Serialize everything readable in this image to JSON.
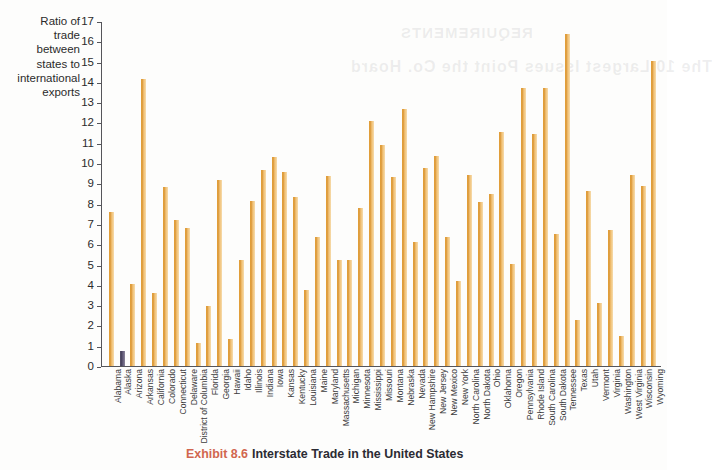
{
  "caption": {
    "number": "Exhibit 8.6",
    "text": "Interstate Trade in the United States"
  },
  "bleed_text": {
    "line1": "REQUIREMENTS",
    "line2": "The 10 Largest Issues Point the Co.  Hoard"
  },
  "y_axis_title_lines": [
    "Ratio of",
    "trade",
    "between",
    "states to",
    "international",
    "exports"
  ],
  "colors": {
    "bar": "#e0a040",
    "bar_highlight": "#f3cf93",
    "bar_alt": "#575168",
    "axis": "#55555a",
    "caption_number": "#d1664f",
    "caption_text": "#2b2b33",
    "background": "#fdfdfc"
  },
  "chart_data": {
    "type": "bar",
    "title": "Interstate Trade in the United States",
    "xlabel": "",
    "ylabel": "Ratio of trade between states to international exports",
    "ylim": [
      0,
      17
    ],
    "ytick_step": 1,
    "yticks": [
      0,
      1,
      2,
      3,
      4,
      5,
      6,
      7,
      8,
      9,
      10,
      11,
      12,
      13,
      14,
      15,
      16,
      17
    ],
    "grid": false,
    "legend": "none",
    "categories": [
      "Alabama",
      "Alaska",
      "Arizona",
      "Arkansas",
      "California",
      "Colorado",
      "Connecticut",
      "Delaware",
      "District of Columbia",
      "Florida",
      "Georgia",
      "Hawaii",
      "Idaho",
      "Illinois",
      "Indiana",
      "Iowa",
      "Kansas",
      "Kentucky",
      "Louisiana",
      "Maine",
      "Maryland",
      "Massachusetts",
      "Michigan",
      "Minnesota",
      "Mississippi",
      "Missouri",
      "Montana",
      "Nebraska",
      "Nevada",
      "New Hampshire",
      "New Jersey",
      "New Mexico",
      "New York",
      "North Carolina",
      "North Dakota",
      "Ohio",
      "Oklahoma",
      "Oregon",
      "Pennsylvania",
      "Rhode Island",
      "South Carolina",
      "South Dakota",
      "Tennessee",
      "Texas",
      "Utah",
      "Vermont",
      "Virginia",
      "Washington",
      "West Virginia",
      "Wisconsin",
      "Wyoming"
    ],
    "values": [
      7.6,
      0.75,
      4.05,
      14.15,
      3.6,
      8.8,
      7.2,
      6.8,
      1.15,
      2.95,
      9.15,
      1.35,
      5.2,
      8.15,
      9.65,
      10.3,
      9.55,
      8.35,
      3.75,
      6.35,
      9.35,
      5.2,
      5.2,
      7.8,
      12.05,
      10.9,
      9.3,
      12.65,
      6.1,
      9.75,
      10.35,
      6.35,
      4.2,
      9.4,
      8.1,
      8.5,
      11.55,
      5.05,
      13.7,
      11.45,
      13.7,
      6.5,
      16.35,
      2.25,
      8.6,
      3.1,
      6.7,
      1.5,
      9.4,
      8.85,
      15.05
    ],
    "highlight_index": 1
  }
}
